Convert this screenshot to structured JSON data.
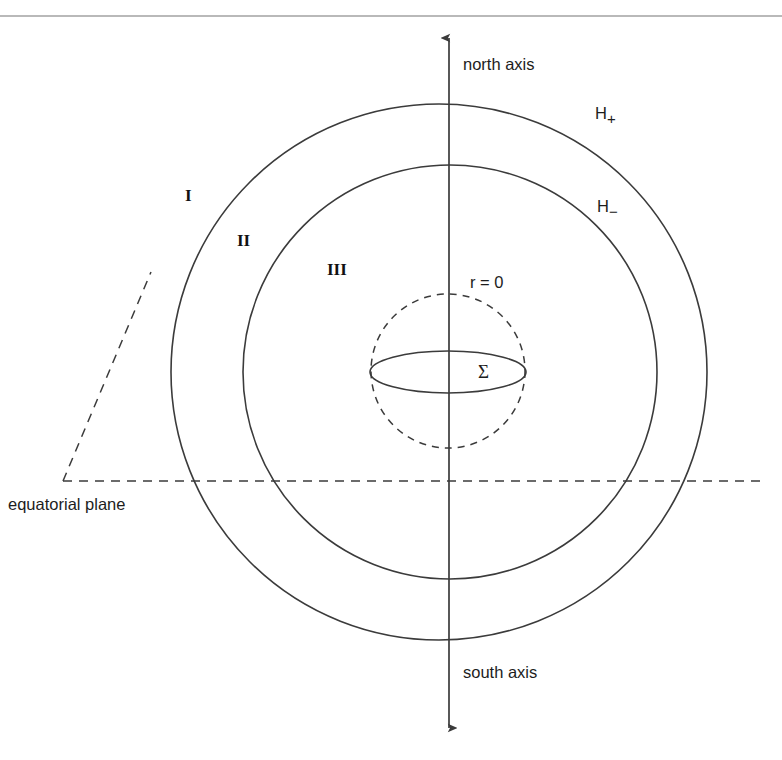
{
  "page": {
    "width": 782,
    "height": 760,
    "background": "#ffffff",
    "ink_color": "#3b3b3b",
    "rule_color": "#b9b9b9",
    "header_fragment": ""
  },
  "figure": {
    "type": "diagram",
    "geometry": {
      "center": {
        "x": 445,
        "y": 372
      },
      "axis_x": 449,
      "outer_circle_radius": 272,
      "middle_circle_radius": 208,
      "inner_dashed_circle": {
        "cx": 448,
        "cy": 371,
        "r": 77
      },
      "sigma_ellipse": {
        "cx": 448,
        "cy": 372,
        "rx": 78,
        "ry": 21
      },
      "equatorial_line_y": 481,
      "equatorial_line_x1": 63,
      "equatorial_line_x2": 758,
      "diagonal_dash": {
        "x1": 63,
        "y1": 481,
        "x2": 151,
        "y2": 272
      },
      "axis_top_y": 30,
      "axis_bottom_y": 735
    },
    "labels": {
      "north_axis": "north axis",
      "south_axis": "south axis",
      "equatorial_plane": "equatorial plane",
      "h_plus": "H",
      "h_plus_sub": "+",
      "h_minus": "H",
      "h_minus_sub": "−",
      "region_one": "I",
      "region_two": "II",
      "region_three": "III",
      "r_zero": "r = 0",
      "sigma": "Σ"
    },
    "label_positions": {
      "north_axis": {
        "x": 463,
        "y": 70
      },
      "south_axis": {
        "x": 463,
        "y": 678
      },
      "equatorial_plane": {
        "x": 8,
        "y": 510
      },
      "h_plus": {
        "x": 595,
        "y": 119
      },
      "h_minus": {
        "x": 597,
        "y": 212
      },
      "region_one": {
        "x": 185,
        "y": 201
      },
      "region_two": {
        "x": 237,
        "y": 246
      },
      "region_three": {
        "x": 327,
        "y": 275
      },
      "r_zero": {
        "x": 470,
        "y": 288
      },
      "sigma": {
        "x": 478,
        "y": 378
      }
    }
  }
}
